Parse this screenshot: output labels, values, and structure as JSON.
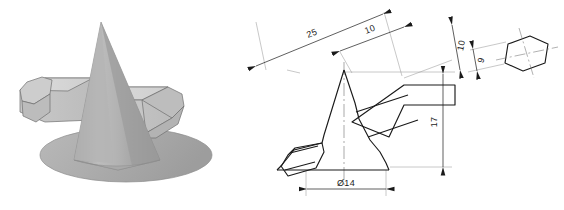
{
  "figure": {
    "background_color": "#ffffff",
    "line_color": "#1a1a1a",
    "thin_line_color": "#8a8a8a"
  },
  "pictorial_view": {
    "name": "shaded-3d-model",
    "description": "Shaded isometric view of a cone with a hexagonal prism passing horizontally through it",
    "shading": {
      "cone_body": "#a8a8a8",
      "cone_light": "#b8b8b8",
      "cone_dark": "#9a9a9a",
      "cone_base": "#b0b0b0",
      "prism_top": "#d8d8d8",
      "prism_side": "#c4c4c4",
      "prism_end": "#cbcbcb",
      "prism_dark": "#ababab",
      "outline": "#5a5a5a"
    }
  },
  "orthographic_view": {
    "name": "dimensioned-drawing",
    "description": "Rotated front view of the cone and prism assembly with dimensions",
    "dimensions": [
      {
        "id": "overall-length",
        "label": "25",
        "value": 25,
        "orientation": "rotated"
      },
      {
        "id": "half-length",
        "label": "10",
        "value": 10,
        "orientation": "rotated"
      },
      {
        "id": "height",
        "label": "17",
        "value": 17,
        "orientation": "vertical"
      },
      {
        "id": "base-diameter",
        "label": "Ø14",
        "value": 14,
        "orientation": "horizontal"
      }
    ]
  },
  "detail_view": {
    "name": "hexagon-section",
    "description": "Hexagonal cross-section detail of the prism",
    "dimensions": [
      {
        "id": "across-corners",
        "label": "10",
        "value": 10,
        "orientation": "rotated"
      },
      {
        "id": "across-flats",
        "label": "9",
        "value": 9,
        "orientation": "rotated"
      }
    ]
  }
}
